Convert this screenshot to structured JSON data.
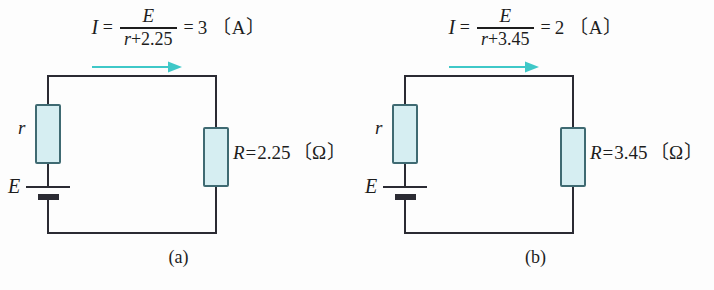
{
  "figure": {
    "background_color": "#fdfdfd",
    "line_color": "#2b2b33",
    "resistor_fill": "#d6eef2",
    "resistor_stroke": "#3f6a72",
    "arrow_color": "#3fc8c8"
  },
  "panels": [
    {
      "id": "a",
      "caption": "(a)",
      "formula": {
        "current_symbol": "I",
        "equals_1": "=",
        "numerator": "E",
        "denominator_var": "r",
        "denominator_plus": "+",
        "denominator_value": "2.25",
        "equals_2": "=",
        "result": "3",
        "unit": "〔A〕",
        "full_text": "I = E / (r + 2.25) = 3 〔A〕"
      },
      "current_arrow": {
        "label": "current-direction",
        "direction": "right"
      },
      "components": {
        "internal_resistor_label": "r",
        "source_label": "E",
        "load_symbol": "R",
        "load_equals": "=",
        "load_value": "2.25",
        "load_unit": "〔Ω〕",
        "load_full": "R = 2.25 〔Ω〕"
      }
    },
    {
      "id": "b",
      "caption": "(b)",
      "formula": {
        "current_symbol": "I",
        "equals_1": "=",
        "numerator": "E",
        "denominator_var": "r",
        "denominator_plus": "+",
        "denominator_value": "3.45",
        "equals_2": "=",
        "result": "2",
        "unit": "〔A〕",
        "full_text": "I = E / (r + 3.45) = 2 〔A〕"
      },
      "current_arrow": {
        "label": "current-direction",
        "direction": "right"
      },
      "components": {
        "internal_resistor_label": "r",
        "source_label": "E",
        "load_symbol": "R",
        "load_equals": "=",
        "load_value": "3.45",
        "load_unit": "〔Ω〕",
        "load_full": "R = 3.45 〔Ω〕"
      }
    }
  ]
}
